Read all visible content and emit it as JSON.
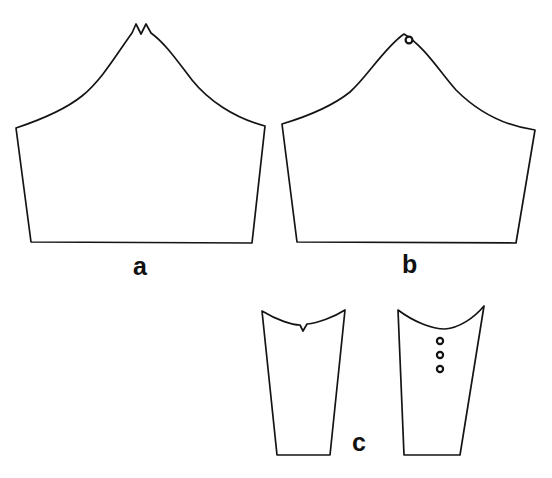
{
  "figure": {
    "background_color": "#ffffff",
    "line_color": "#141414",
    "width": 552,
    "height": 478,
    "labels": {
      "a": "a",
      "b": "b",
      "c": "c"
    },
    "pieces": [
      {
        "id": "a",
        "name": "sleeve-cap-notched",
        "label": "a",
        "description": "Sleeve cap with V-notch at crown apex",
        "has_notch": true,
        "notch_count": 1,
        "marker_count": 0,
        "path": "M 16 128 C 34 122 62 112 82 96 C 102 80 118 52 132 33 L 136 24 L 141 34 L 146 24 L 151 33 C 166 44 178 62 192 80 C 208 100 234 118 265 126 L 252 243 L 31 242 Z"
      },
      {
        "id": "b",
        "name": "sleeve-cap-drill-hole",
        "label": "b",
        "description": "Sleeve cap with smooth crown and single drill-hole marker",
        "has_notch": false,
        "notch_count": 0,
        "marker_count": 1,
        "path": "M 282 124 C 302 118 330 108 350 92 C 368 76 384 48 404 34 C 424 46 440 72 456 90 C 478 112 506 126 535 130 L 516 243 L 297 242 Z",
        "markers": [
          {
            "name": "drill-hole",
            "cx": 409,
            "cy": 40,
            "r": 3.4
          }
        ]
      },
      {
        "id": "c-left",
        "name": "sleeve-underpiece-notched",
        "label": "c",
        "description": "Tapering sleeve under-piece with V-notch on concave top edge",
        "has_notch": true,
        "notch_count": 1,
        "marker_count": 0,
        "path": "M 262 311 C 277 320 292 325 300 325 L 303 331 L 307 324 C 318 323 334 317 345 310 L 330 455 L 277 455 Z"
      },
      {
        "id": "c-right",
        "name": "sleeve-underpiece-drill-holes",
        "label": "c",
        "description": "Tapering sleeve under-piece with three vertical drill-hole markers",
        "has_notch": false,
        "notch_count": 0,
        "marker_count": 3,
        "path": "M 398 310 C 414 322 432 329 445 329 C 459 328 474 318 484 306 L 460 455 L 404 455 Z",
        "markers": [
          {
            "name": "drill-hole-top",
            "cx": 440,
            "cy": 341,
            "r": 3.1
          },
          {
            "name": "drill-hole-middle",
            "cx": 440,
            "cy": 355,
            "r": 3.1
          },
          {
            "name": "drill-hole-bottom",
            "cx": 440,
            "cy": 369,
            "r": 3.1
          }
        ]
      }
    ]
  }
}
